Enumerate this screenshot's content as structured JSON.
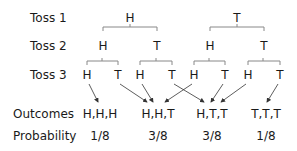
{
  "rows": {
    "toss1": "Toss 1",
    "toss2": "Toss 2",
    "toss3": "Toss 3",
    "outcomes": "Outcomes",
    "probability": "Probability"
  },
  "toss1": [
    "H",
    "T"
  ],
  "toss2": [
    "H",
    "T",
    "H",
    "T"
  ],
  "toss3": [
    "H",
    "T",
    "H",
    "T",
    "H",
    "T",
    "H",
    "T"
  ],
  "outcomes": [
    "H,H,H",
    "H,H,T",
    "H,T,T",
    "T,T,T"
  ],
  "probability": [
    "1/8",
    "3/8",
    "3/8",
    "1/8"
  ],
  "colors": {
    "text": "#1a1a1a",
    "lines": "#777777"
  }
}
